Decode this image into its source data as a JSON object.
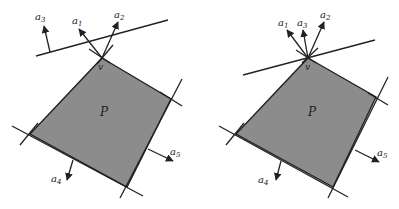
{
  "figures": [
    {
      "id": "left",
      "polygon_label": "P",
      "vertex_label": "v",
      "fill_color": "#8c8c8c",
      "stroke_color": "#222222",
      "vectors": [
        {
          "base": "a",
          "sub": "1"
        },
        {
          "base": "a",
          "sub": "2"
        },
        {
          "base": "a",
          "sub": "3"
        },
        {
          "base": "a",
          "sub": "4"
        },
        {
          "base": "a",
          "sub": "5"
        }
      ]
    },
    {
      "id": "right",
      "polygon_label": "P",
      "vertex_label": "v",
      "fill_color": "#8c8c8c",
      "stroke_color": "#222222",
      "vectors": [
        {
          "base": "a",
          "sub": "1"
        },
        {
          "base": "a",
          "sub": "2"
        },
        {
          "base": "a",
          "sub": "3"
        },
        {
          "base": "a",
          "sub": "4"
        },
        {
          "base": "a",
          "sub": "5"
        }
      ]
    }
  ]
}
